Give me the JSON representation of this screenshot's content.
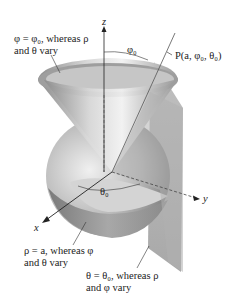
{
  "diagram": {
    "type": "spherical-coordinates-surfaces",
    "axes": {
      "x": "x",
      "y": "y",
      "z": "z"
    },
    "point_label": "P(a, φ₀, θ₀)",
    "angle_labels": {
      "phi0": "φ₀",
      "theta0": "θ₀"
    },
    "annotations": {
      "cone": {
        "line1": "φ = φ₀, whereas ρ",
        "line2": "and θ vary"
      },
      "sphere": {
        "line1": "ρ = a, whereas φ",
        "line2": "and θ vary"
      },
      "plane": {
        "line1": "θ = θ₀, whereas ρ",
        "line2": "and φ vary"
      }
    },
    "colors": {
      "surface_light": "#e6e6e6",
      "surface_mid": "#bdbdbd",
      "surface_dark": "#8a8a8a",
      "plane": "#a9a9a9",
      "axis": "#222222"
    }
  }
}
